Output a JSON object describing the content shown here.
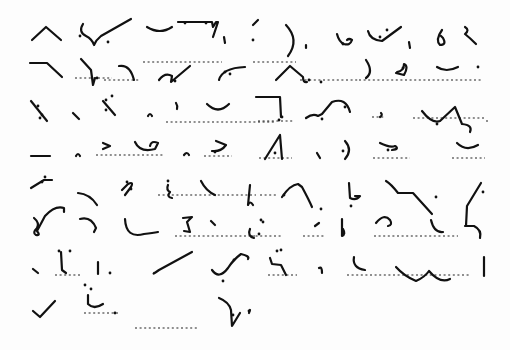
{
  "page": {
    "background": "#fdfdfd",
    "ink": "#111111"
  },
  "guides": [
    [
      143,
      62,
      222,
      62
    ],
    [
      253,
      62,
      270,
      62
    ],
    [
      272,
      62,
      296,
      62
    ],
    [
      75,
      78,
      112,
      78
    ],
    [
      300,
      80,
      358,
      80
    ],
    [
      359,
      80,
      481,
      80
    ],
    [
      104,
      80,
      140,
      80
    ],
    [
      166,
      122,
      276,
      122
    ],
    [
      258,
      121,
      293,
      121
    ],
    [
      372,
      117,
      385,
      117
    ],
    [
      413,
      118,
      486,
      118
    ],
    [
      488,
      121,
      485,
      121
    ],
    [
      96,
      155,
      163,
      155
    ],
    [
      204,
      156,
      232,
      156
    ],
    [
      259,
      158,
      292,
      158
    ],
    [
      373,
      158,
      410,
      158
    ],
    [
      452,
      158,
      485,
      158
    ],
    [
      158,
      195,
      256,
      195
    ],
    [
      260,
      195,
      276,
      195
    ],
    [
      175,
      236,
      255,
      236
    ],
    [
      251,
      236,
      282,
      236
    ],
    [
      303,
      236,
      325,
      236
    ],
    [
      374,
      236,
      458,
      236
    ],
    [
      55,
      275,
      82,
      275
    ],
    [
      268,
      275,
      297,
      275
    ],
    [
      347,
      275,
      470,
      275
    ],
    [
      84,
      313,
      118,
      313
    ],
    [
      135,
      328,
      197,
      328
    ]
  ],
  "outlines": [
    {
      "d": "M32 40 L46 27 L61 40",
      "dots": []
    },
    {
      "d": "M83 24 Q78 32 86 36 Q92 39 94 45 Q96 40 101 36 L131 19",
      "dots": [
        [
          80,
          36
        ],
        [
          108,
          42
        ]
      ]
    },
    {
      "d": "M147 27 Q160 35 172 27",
      "dots": []
    },
    {
      "d": "M178 22 L212 22 L213 27 L216 22 L218 22 L213 37",
      "dots": [
        [
          185,
          23
        ],
        [
          206,
          23
        ]
      ]
    },
    {
      "d": "M224 37 L225 43",
      "dots": []
    },
    {
      "d": "M253 25 L258 20",
      "dots": [
        [
          253,
          40
        ]
      ]
    },
    {
      "d": "M286 25 Q300 40 288 56",
      "dots": []
    },
    {
      "d": "M306 45 L306 48",
      "dots": []
    },
    {
      "d": "M337 34 Q339 42 344 44 Q350 46 352 40 Q349 38 347 40",
      "dots": [
        [
          343,
          44
        ]
      ]
    },
    {
      "d": "M368 31 Q370 40 382 41 L401 27",
      "dots": [
        [
          380,
          37
        ],
        [
          387,
          30
        ]
      ]
    },
    {
      "d": "M409 42 L410 48",
      "dots": []
    },
    {
      "d": "M442 30 Q435 40 440 45 Q447 45 443 38 L441 36",
      "dots": []
    },
    {
      "d": "M465 27 Q470 30 465 34 Q470 38 476 44",
      "dots": []
    },
    {
      "d": "M30 63 L47 63 L62 77",
      "dots": []
    },
    {
      "d": "M81 59 L91 70 L93 85 L95 78",
      "dots": [
        [
          97,
          78
        ]
      ]
    },
    {
      "d": "M119 66 Q130 64 134 80",
      "dots": []
    },
    {
      "d": "M159 80 Q165 72 172 76 L171 82 L190 66",
      "dots": [
        [
          175,
          81
        ]
      ]
    },
    {
      "d": "M219 80 Q222 68 245 67",
      "dots": [
        [
          225,
          72
        ],
        [
          230,
          74
        ]
      ]
    },
    {
      "d": "M276 80 L290 66 L303 77 Q303 83 307 82",
      "dots": [
        [
          309,
          80
        ],
        [
          321,
          82
        ]
      ]
    },
    {
      "d": "M366 60 Q374 72 366 78",
      "dots": []
    },
    {
      "d": "M397 72 Q404 71 404 64 Q409 66 404 75 L396 73",
      "dots": [
        [
          403,
          68
        ]
      ]
    },
    {
      "d": "M437 67 Q446 73 458 67",
      "dots": [
        [
          478,
          67
        ]
      ]
    },
    {
      "d": "M31 101 L47 121",
      "dots": [
        [
          40,
          118
        ],
        [
          42,
          115
        ],
        [
          38,
          106
        ]
      ]
    },
    {
      "d": "M73 113 L79 119",
      "dots": []
    },
    {
      "d": "M103 101 L115 115",
      "dots": [
        [
          106,
          100
        ],
        [
          112,
          96
        ],
        [
          106,
          110
        ]
      ]
    },
    {
      "d": "M148 116 Q150 112 152 116",
      "dots": []
    },
    {
      "d": "M176 103 Q178 106 177 109",
      "dots": []
    },
    {
      "d": "M207 104 Q218 115 229 104",
      "dots": []
    },
    {
      "d": "M256 97 L280 97 L281 117",
      "dots": [
        [
          282,
          117
        ],
        [
          279,
          120
        ]
      ]
    },
    {
      "d": "M306 118 Q313 113 318 116 L322 114 L332 102 Q346 97 350 112",
      "dots": [
        [
          322,
          119
        ],
        [
          345,
          107
        ]
      ]
    },
    {
      "d": "M381 113 Q383 115 380 117",
      "dots": []
    },
    {
      "d": "M422 111 Q432 124 440 121 L455 107 L462 124 Q473 125 470 132",
      "dots": [
        [
          437,
          124
        ]
      ]
    },
    {
      "d": "M31 156 L50 156",
      "dots": []
    },
    {
      "d": "M76 156 Q78 152 80 156",
      "dots": []
    },
    {
      "d": "M103 143 L110 146 L103 149",
      "dots": []
    },
    {
      "d": "M135 142 Q140 153 155 149 L158 143 Q151 140 150 146",
      "dots": []
    },
    {
      "d": "M184 155 Q187 151 189 155",
      "dots": []
    },
    {
      "d": "M216 141 L226 145 Q221 152 212 151",
      "dots": [
        [
          215,
          152
        ]
      ]
    },
    {
      "d": "M265 159 L280 135 L282 159",
      "dots": [
        [
          275,
          153
        ]
      ]
    },
    {
      "d": "M317 153 L320 158",
      "dots": []
    },
    {
      "d": "M345 141 Q353 150 345 159",
      "dots": [
        [
          343,
          151
        ]
      ]
    },
    {
      "d": "M380 143 Q390 148 395 146 Q400 149 392 150",
      "dots": [
        [
          388,
          150
        ]
      ]
    },
    {
      "d": "M457 143 Q466 152 478 145",
      "dots": []
    },
    {
      "d": "M31 188 L44 180 L52 180",
      "dots": [
        [
          42,
          182
        ],
        [
          45,
          177
        ]
      ]
    },
    {
      "d": "M78 193 Q90 194 97 205",
      "dots": []
    },
    {
      "d": "M122 190 L128 184 Q134 181 131 187 L125 195",
      "dots": [
        [
          131,
          189
        ],
        [
          127,
          182
        ]
      ]
    },
    {
      "d": "M168 185 Q166 190 170 192 Q166 197 172 198",
      "dots": [
        [
          168,
          181
        ]
      ]
    },
    {
      "d": "M201 181 Q206 191 215 195",
      "dots": []
    },
    {
      "d": "M250 185 L248 205 Q250 200 253 205",
      "dots": []
    },
    {
      "d": "M282 197 Q290 185 298 184 L302 187 Q309 200 312 207",
      "dots": [
        [
          321,
          209
        ],
        [
          284,
          195
        ]
      ]
    },
    {
      "d": "M349 183 L350 198 Q356 201 360 196 L355 196",
      "dots": [
        [
          351,
          206
        ]
      ]
    },
    {
      "d": "M386 181 Q391 184 398 193 L413 193 L432 214",
      "dots": [
        [
          436,
          197
        ]
      ]
    },
    {
      "d": "M481 183 L467 206 L466 226",
      "dots": [
        [
          483,
          192
        ]
      ]
    },
    {
      "d": "M34 218 Q40 223 37 228 Q32 233 36 235 Q41 236 37 231 L45 216 Q55 205 64 208 L64 212",
      "dots": []
    },
    {
      "d": "M80 219 Q91 216 96 228 L94 232",
      "dots": []
    },
    {
      "d": "M125 219 Q126 239 144 234 Q153 233 158 232",
      "dots": []
    },
    {
      "d": "M183 218 L192 217 L187 222 L190 232 L184 231",
      "dots": []
    },
    {
      "d": "M211 221 L215 225",
      "dots": []
    },
    {
      "d": "M250 229 Q247 236 254 238",
      "dots": [
        [
          259,
          234
        ],
        [
          261,
          220
        ],
        [
          263,
          222
        ]
      ]
    },
    {
      "d": "M319 223 L315 226",
      "dots": []
    },
    {
      "d": "M342 219 L342 236 Q346 234 343 229",
      "dots": []
    },
    {
      "d": "M376 223 Q384 213 390 220 Q393 225 388 226",
      "dots": []
    },
    {
      "d": "M431 220 Q434 233 443 232",
      "dots": []
    },
    {
      "d": "M465 226 L474 226 Q482 230 480 238",
      "dots": []
    },
    {
      "d": "M33 269 L38 273",
      "dots": []
    },
    {
      "d": "M61 252 L62 270 L66 273",
      "dots": [
        [
          59,
          251
        ],
        [
          70,
          251
        ]
      ]
    },
    {
      "d": "M98 262 L98 274",
      "dots": [
        [
          110,
          273
        ]
      ]
    },
    {
      "d": "M154 273 Q152 275 159 270 L192 252",
      "dots": []
    },
    {
      "d": "M212 270 Q219 280 228 268 Q233 260 241 254 Q250 256 248 259",
      "dots": [
        [
          234,
          260
        ],
        [
          223,
          281
        ]
      ]
    },
    {
      "d": "M270 258 L272 264 L281 265 L286 275",
      "dots": [
        [
          277,
          251
        ],
        [
          281,
          250
        ]
      ]
    },
    {
      "d": "M319 268 Q322 266 322 273",
      "dots": []
    },
    {
      "d": "M354 257 Q352 268 365 270",
      "dots": []
    },
    {
      "d": "M396 267 Q404 276 416 281 Q425 277 429 271 Q440 284 450 279",
      "dots": []
    },
    {
      "d": "M484 257 L484 276",
      "dots": []
    },
    {
      "d": "M33 311 L40 317 L55 301",
      "dots": []
    },
    {
      "d": "M88 295 L88 304 Q94 310 103 304",
      "dots": [
        [
          85,
          285
        ],
        [
          91,
          289
        ],
        [
          115,
          313
        ]
      ]
    },
    {
      "d": "M219 298 Q229 302 231 310 L232 326 L240 313",
      "dots": [
        [
          233,
          315
        ],
        [
          249,
          311
        ]
      ]
    },
    {
      "d": "M250 310 L249 313",
      "dots": []
    }
  ]
}
